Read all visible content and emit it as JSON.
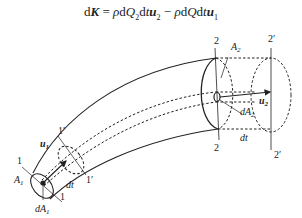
{
  "equation": {
    "lhs": "dK",
    "rhs_term1": "ρdQ₂dtu₂",
    "operator": "−",
    "rhs_term2": "ρdQdtu₁",
    "full": "dK = ρdQ₂dtu₂ − ρdQdtu₁"
  },
  "labels": {
    "section_2_top": "2",
    "section_2_bottom": "2",
    "section_2p_top": "2′",
    "section_2p_bottom": "2′",
    "area_A2": "A",
    "area_A2_sub": "2",
    "velocity_u2": "u",
    "velocity_u2_sub": "2",
    "area_dA2": "dA",
    "area_dA2_sub": "2",
    "dt_right": "dt",
    "section_1_top": "1",
    "section_1_bottom": "1",
    "section_1p_top": "1′",
    "section_1p_bottom": "1′",
    "velocity_u1": "u",
    "velocity_u1_sub": "1",
    "area_A1": "A",
    "area_A1_sub": "1",
    "area_dA1": "dA",
    "area_dA1_sub": "1",
    "dt_left": "dt"
  },
  "colors": {
    "line": "#222222",
    "background": "#ffffff"
  }
}
